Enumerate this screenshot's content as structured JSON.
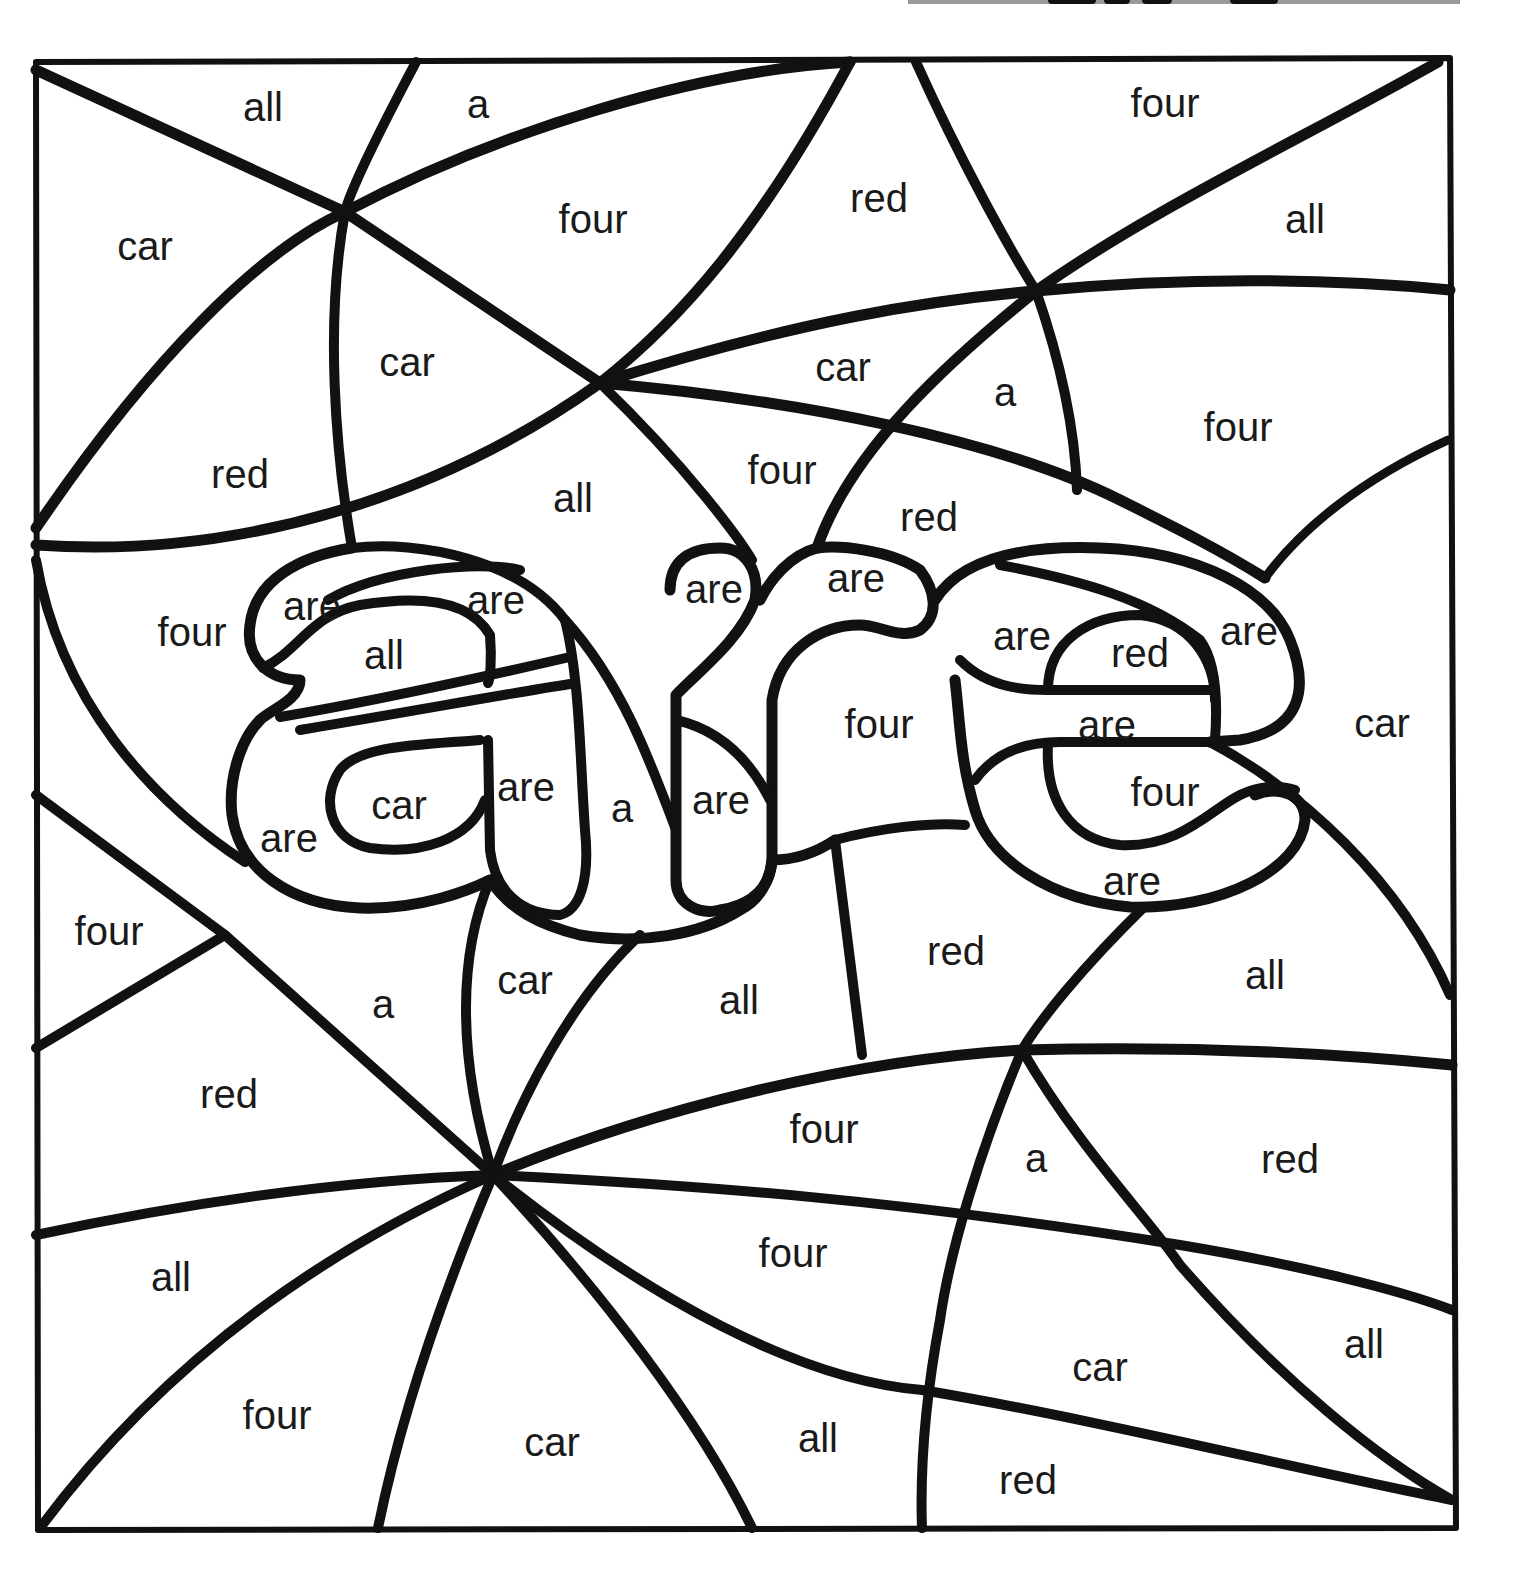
{
  "worksheet": {
    "title_partial": "are",
    "sight_word": "are",
    "frame": {
      "left": 36,
      "top": 60,
      "right": 1452,
      "bottom": 1528
    },
    "stroke_color": "#111111",
    "background": "#ffffff",
    "word_list": [
      "are",
      "all",
      "a",
      "four",
      "red",
      "car"
    ]
  },
  "regions": [
    {
      "word": "all",
      "x": 263,
      "y": 107
    },
    {
      "word": "a",
      "x": 478,
      "y": 104
    },
    {
      "word": "four",
      "x": 1165,
      "y": 103
    },
    {
      "word": "car",
      "x": 145,
      "y": 246
    },
    {
      "word": "four",
      "x": 593,
      "y": 219
    },
    {
      "word": "red",
      "x": 879,
      "y": 198
    },
    {
      "word": "all",
      "x": 1305,
      "y": 219
    },
    {
      "word": "car",
      "x": 407,
      "y": 362
    },
    {
      "word": "car",
      "x": 843,
      "y": 367
    },
    {
      "word": "a",
      "x": 1005,
      "y": 392
    },
    {
      "word": "four",
      "x": 1238,
      "y": 427
    },
    {
      "word": "red",
      "x": 240,
      "y": 474
    },
    {
      "word": "all",
      "x": 573,
      "y": 498
    },
    {
      "word": "four",
      "x": 782,
      "y": 470
    },
    {
      "word": "red",
      "x": 929,
      "y": 517
    },
    {
      "word": "four",
      "x": 192,
      "y": 632
    },
    {
      "word": "are",
      "x": 312,
      "y": 606
    },
    {
      "word": "are",
      "x": 496,
      "y": 600
    },
    {
      "word": "all",
      "x": 384,
      "y": 655
    },
    {
      "word": "are",
      "x": 714,
      "y": 589
    },
    {
      "word": "are",
      "x": 856,
      "y": 578
    },
    {
      "word": "are",
      "x": 1022,
      "y": 636
    },
    {
      "word": "red",
      "x": 1140,
      "y": 653
    },
    {
      "word": "are",
      "x": 1249,
      "y": 631
    },
    {
      "word": "four",
      "x": 879,
      "y": 724
    },
    {
      "word": "are",
      "x": 1107,
      "y": 725
    },
    {
      "word": "car",
      "x": 1382,
      "y": 723
    },
    {
      "word": "car",
      "x": 399,
      "y": 805
    },
    {
      "word": "are",
      "x": 526,
      "y": 787
    },
    {
      "word": "a",
      "x": 622,
      "y": 808
    },
    {
      "word": "are",
      "x": 721,
      "y": 800
    },
    {
      "word": "are",
      "x": 289,
      "y": 838
    },
    {
      "word": "four",
      "x": 1165,
      "y": 792
    },
    {
      "word": "are",
      "x": 1132,
      "y": 881
    },
    {
      "word": "four",
      "x": 109,
      "y": 931
    },
    {
      "word": "a",
      "x": 383,
      "y": 1004
    },
    {
      "word": "car",
      "x": 525,
      "y": 980
    },
    {
      "word": "all",
      "x": 739,
      "y": 1000
    },
    {
      "word": "red",
      "x": 956,
      "y": 951
    },
    {
      "word": "all",
      "x": 1265,
      "y": 975
    },
    {
      "word": "red",
      "x": 229,
      "y": 1094
    },
    {
      "word": "four",
      "x": 824,
      "y": 1129
    },
    {
      "word": "a",
      "x": 1036,
      "y": 1158
    },
    {
      "word": "red",
      "x": 1290,
      "y": 1159
    },
    {
      "word": "all",
      "x": 171,
      "y": 1277
    },
    {
      "word": "four",
      "x": 793,
      "y": 1253
    },
    {
      "word": "car",
      "x": 1100,
      "y": 1367
    },
    {
      "word": "all",
      "x": 1364,
      "y": 1344
    },
    {
      "word": "four",
      "x": 277,
      "y": 1415
    },
    {
      "word": "car",
      "x": 552,
      "y": 1442
    },
    {
      "word": "all",
      "x": 818,
      "y": 1438
    },
    {
      "word": "red",
      "x": 1028,
      "y": 1480
    }
  ]
}
